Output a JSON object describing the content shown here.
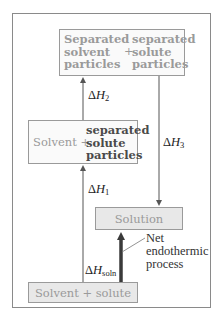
{
  "diagram": {
    "type": "enthalpy-of-solution-cycle",
    "boxes": {
      "top": {
        "left_lines": [
          "Separated",
          "solvent",
          "particles"
        ],
        "plus": "+",
        "right_lines": [
          "separated",
          "solute",
          "particles"
        ]
      },
      "middle": {
        "left_text": "Solvent +",
        "right_lines": [
          "separated",
          "solute",
          "particles"
        ]
      },
      "solution": {
        "label": "Solution"
      },
      "bottom": {
        "label": "Solvent + solute"
      }
    },
    "arrows": {
      "dh1": {
        "delta": "Δ",
        "symbol": "H",
        "sub": "1",
        "direction": "up"
      },
      "dh2": {
        "delta": "Δ",
        "symbol": "H",
        "sub": "2",
        "direction": "up"
      },
      "dh3": {
        "delta": "Δ",
        "symbol": "H",
        "sub": "3",
        "direction": "down"
      },
      "dhsoln": {
        "delta": "Δ",
        "symbol": "H",
        "sub": "soln",
        "direction": "up",
        "emphasis": "thick"
      }
    },
    "annotation": {
      "lines": [
        "Net",
        "endothermic",
        "process"
      ]
    },
    "colors": {
      "frame": "#8a8a8a",
      "box_border": "#9a9a9a",
      "box_fill": "#e8e8e8",
      "text_light": "#9a9a9a",
      "text_dark": "#4a4a4a",
      "arrow": "#555555",
      "thick_arrow": "#3a3a3a"
    }
  }
}
